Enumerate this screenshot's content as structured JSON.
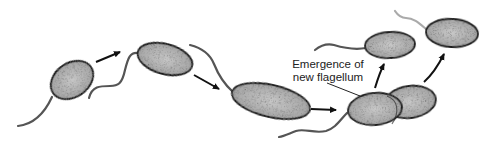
{
  "diagram": {
    "annotation": {
      "line1": "Emergence of",
      "line2": "new flagellum"
    },
    "colors": {
      "cell_fill": "#b8b8b8",
      "cell_outline": "#1a1a1a",
      "flagellum": "#555555",
      "new_flagellum": "#aaaaaa",
      "arrow": "#111111",
      "text": "#222222"
    },
    "cells": [
      {
        "id": "cell-1",
        "stage": "swimming cell"
      },
      {
        "id": "cell-2",
        "stage": "growing cell"
      },
      {
        "id": "cell-3",
        "stage": "elongated cell"
      },
      {
        "id": "cell-4",
        "stage": "dividing cell"
      },
      {
        "id": "cell-5",
        "stage": "daughter cell (old flagellum)"
      },
      {
        "id": "cell-6",
        "stage": "daughter cell (new flagellum)"
      }
    ],
    "arrows": 5
  }
}
